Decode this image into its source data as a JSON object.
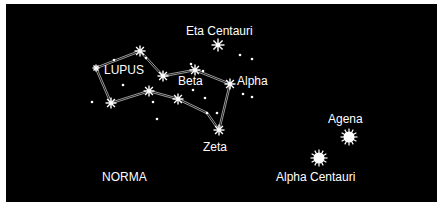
{
  "diagram": {
    "background": "#000000",
    "foreground": "#ffffff",
    "labels": [
      {
        "id": "lupus",
        "text": "LUPUS",
        "x": 104,
        "y": 64
      },
      {
        "id": "beta",
        "text": "Beta",
        "x": 178,
        "y": 75
      },
      {
        "id": "alpha",
        "text": "Alpha",
        "x": 237,
        "y": 75
      },
      {
        "id": "eta-centauri",
        "text": "Eta Centauri",
        "x": 186,
        "y": 25
      },
      {
        "id": "zeta",
        "text": "Zeta",
        "x": 203,
        "y": 141
      },
      {
        "id": "norma",
        "text": "NORMA",
        "x": 102,
        "y": 171
      },
      {
        "id": "agena",
        "text": "Agena",
        "x": 328,
        "y": 113
      },
      {
        "id": "alpha-centauri",
        "text": "Alpha  Centauri",
        "x": 276,
        "y": 171
      }
    ],
    "stars": [
      {
        "name": "lupus-top",
        "x": 140,
        "y": 51,
        "size": 4
      },
      {
        "name": "lupus-left",
        "x": 96,
        "y": 68,
        "size": 2
      },
      {
        "name": "lupus-mid",
        "x": 163,
        "y": 76,
        "size": 4
      },
      {
        "name": "lupus-bottom-left",
        "x": 111,
        "y": 103,
        "size": 4
      },
      {
        "name": "lupus-center",
        "x": 149,
        "y": 91,
        "size": 4
      },
      {
        "name": "beta",
        "x": 195,
        "y": 70,
        "size": 4
      },
      {
        "name": "alpha",
        "x": 230,
        "y": 84,
        "size": 4
      },
      {
        "name": "gamma",
        "x": 178,
        "y": 99,
        "size": 4
      },
      {
        "name": "zeta",
        "x": 219,
        "y": 130,
        "size": 4
      },
      {
        "name": "eta-centauri",
        "x": 218,
        "y": 45,
        "size": 5
      },
      {
        "name": "agena",
        "x": 349,
        "y": 137,
        "size": 7
      },
      {
        "name": "alpha-centauri",
        "x": 319,
        "y": 158,
        "size": 7
      }
    ],
    "small_stars": [
      [
        92,
        102
      ],
      [
        114,
        60
      ],
      [
        146,
        58
      ],
      [
        123,
        85
      ],
      [
        153,
        102
      ],
      [
        157,
        119
      ],
      [
        191,
        64
      ],
      [
        193,
        90
      ],
      [
        205,
        98
      ],
      [
        207,
        113
      ],
      [
        217,
        113
      ],
      [
        240,
        55
      ],
      [
        252,
        59
      ],
      [
        243,
        94
      ],
      [
        252,
        97
      ],
      [
        203,
        71
      ]
    ],
    "lines": [
      [
        [
          96,
          68
        ],
        [
          140,
          51
        ]
      ],
      [
        [
          140,
          51
        ],
        [
          163,
          76
        ]
      ],
      [
        [
          163,
          76
        ],
        [
          195,
          70
        ]
      ],
      [
        [
          195,
          70
        ],
        [
          230,
          84
        ]
      ],
      [
        [
          96,
          68
        ],
        [
          111,
          103
        ]
      ],
      [
        [
          111,
          103
        ],
        [
          149,
          91
        ]
      ],
      [
        [
          149,
          91
        ],
        [
          178,
          99
        ]
      ],
      [
        [
          178,
          99
        ],
        [
          207,
          113
        ]
      ],
      [
        [
          207,
          113
        ],
        [
          219,
          130
        ]
      ],
      [
        [
          219,
          130
        ],
        [
          230,
          84
        ]
      ]
    ]
  }
}
